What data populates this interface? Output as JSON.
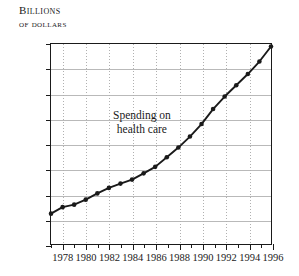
{
  "axis_title": {
    "line1": "Billions",
    "line2": "of dollars"
  },
  "annotation": {
    "line1": "Spending on",
    "line2": "health care"
  },
  "chart_data": {
    "type": "line",
    "title": "",
    "subtitle": "",
    "xlabel": "",
    "ylabel": "Billions of dollars",
    "ylim": [
      0,
      800
    ],
    "xlim": [
      1977,
      1996
    ],
    "ytick_step": 100,
    "yticks": [
      0,
      100,
      200,
      300,
      400,
      500,
      600,
      700,
      800
    ],
    "ytick_labels": [
      "0",
      "100",
      "200",
      "300",
      "400",
      "500",
      "600",
      "700",
      "800"
    ],
    "xticks": [
      1978,
      1980,
      1982,
      1984,
      1986,
      1988,
      1990,
      1992,
      1994,
      1996
    ],
    "xtick_labels": [
      "1978",
      "1980",
      "1982",
      "1984",
      "1986",
      "1988",
      "1990",
      "1992",
      "1994",
      "1996"
    ],
    "xminor_ticks": [
      1977,
      1978,
      1979,
      1980,
      1981,
      1982,
      1983,
      1984,
      1985,
      1986,
      1987,
      1988,
      1989,
      1990,
      1991,
      1992,
      1993,
      1994,
      1995,
      1996
    ],
    "grid": true,
    "grid_horizontal_style": "solid",
    "grid_vertical_style": "dotted",
    "legend": "none",
    "annotation_text": "Spending on health care",
    "marker": "filled-circle",
    "line_color": "#1a1a1a",
    "marker_color": "#1a1a1a",
    "grid_color": "#b9b9b9",
    "background_color": "#ffffff",
    "x": [
      1977,
      1978,
      1979,
      1980,
      1981,
      1982,
      1983,
      1984,
      1985,
      1986,
      1987,
      1988,
      1989,
      1990,
      1991,
      1992,
      1993,
      1994,
      1995,
      1996
    ],
    "values": [
      122,
      148,
      158,
      178,
      203,
      225,
      242,
      258,
      283,
      309,
      347,
      386,
      430,
      480,
      540,
      590,
      635,
      680,
      730,
      790
    ],
    "series": [
      {
        "name": "Spending on health care",
        "values": [
          122,
          148,
          158,
          178,
          203,
          225,
          242,
          258,
          283,
          309,
          347,
          386,
          430,
          480,
          540,
          590,
          635,
          680,
          730,
          790
        ]
      }
    ]
  }
}
